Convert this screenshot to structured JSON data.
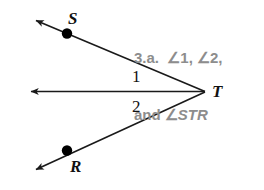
{
  "figure": {
    "background_color": "#ffffff",
    "line_color": "#1a1a1a",
    "point_color": "#000000",
    "prompt_color": "#8d8d8d",
    "width": 264,
    "height": 190
  },
  "prompt": {
    "item_number": "3.a.",
    "line1": "3.a.  ∠1, ∠2,",
    "line2_prefix": "and ∠",
    "line2_points": "STR",
    "full_text": "3.a.  ∠1, ∠2, and ∠STR"
  },
  "labels": {
    "point_s": "S",
    "point_r": "R",
    "point_t": "T",
    "angle_1": "1",
    "angle_2": "2"
  },
  "points": {
    "S": {
      "x": 67,
      "y": 33
    },
    "R": {
      "x": 67,
      "y": 150
    },
    "T": {
      "x": 206,
      "y": 92
    }
  },
  "rays": [
    {
      "name": "ray-TS",
      "from": "T",
      "through": "S",
      "arrow_tip": {
        "x": 31,
        "y": 17
      }
    },
    {
      "name": "ray-T-horizontal",
      "from": "T",
      "through": "midline",
      "arrow_tip": {
        "x": 26,
        "y": 91
      }
    },
    {
      "name": "ray-TR",
      "from": "T",
      "through": "R",
      "arrow_tip": {
        "x": 31,
        "y": 173
      }
    }
  ]
}
